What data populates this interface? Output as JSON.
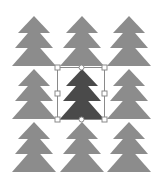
{
  "canvas": {
    "width": 167,
    "height": 186,
    "background": "#ffffff"
  },
  "colors": {
    "tree": "#8c8c8c",
    "tree_selected": "#4a4a4a",
    "selection_stroke": "#8a8a8a",
    "handle_fill": "#ffffff"
  },
  "grid": {
    "columns": [
      34,
      82,
      129
    ],
    "rows": [
      16,
      69,
      122
    ],
    "tiers": [
      {
        "dy_apex": 0,
        "dy_base": 17,
        "half_width": 16
      },
      {
        "dy_apex": 10,
        "dy_base": 32,
        "half_width": 19
      },
      {
        "dy_apex": 25,
        "dy_base": 50,
        "half_width": 22
      }
    ]
  },
  "trees": [
    {
      "id": "tree-r1-c1",
      "row": 0,
      "col": 0,
      "selected": false
    },
    {
      "id": "tree-r1-c2",
      "row": 0,
      "col": 1,
      "selected": false
    },
    {
      "id": "tree-r1-c3",
      "row": 0,
      "col": 2,
      "selected": false
    },
    {
      "id": "tree-r2-c1",
      "row": 1,
      "col": 0,
      "selected": false
    },
    {
      "id": "tree-r2-c2",
      "row": 1,
      "col": 1,
      "selected": true
    },
    {
      "id": "tree-r2-c3",
      "row": 1,
      "col": 2,
      "selected": false
    },
    {
      "id": "tree-r3-c1",
      "row": 2,
      "col": 0,
      "selected": false
    },
    {
      "id": "tree-r3-c2",
      "row": 2,
      "col": 1,
      "selected": false
    },
    {
      "id": "tree-r3-c3",
      "row": 2,
      "col": 2,
      "selected": false
    }
  ],
  "selection": {
    "x": 57,
    "y": 67,
    "width": 47,
    "height": 52,
    "handles": [
      {
        "name": "handle-top-left",
        "shape": "square",
        "x": 57,
        "y": 67
      },
      {
        "name": "handle-top-center",
        "shape": "circle",
        "x": 81,
        "y": 67
      },
      {
        "name": "handle-top-right",
        "shape": "square",
        "x": 104,
        "y": 67
      },
      {
        "name": "handle-middle-left",
        "shape": "square",
        "x": 57,
        "y": 93
      },
      {
        "name": "handle-middle-right",
        "shape": "square",
        "x": 104,
        "y": 93
      },
      {
        "name": "handle-bottom-left",
        "shape": "square",
        "x": 57,
        "y": 119
      },
      {
        "name": "handle-bottom-center",
        "shape": "circle",
        "x": 81,
        "y": 119
      },
      {
        "name": "handle-bottom-right",
        "shape": "square",
        "x": 104,
        "y": 119
      }
    ]
  }
}
